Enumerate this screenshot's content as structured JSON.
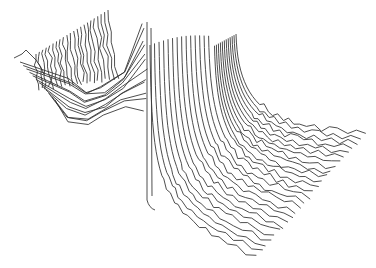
{
  "chart_data": {
    "type": "surface-waterfall-wireframe",
    "title": "",
    "xlabel": "",
    "ylabel": "",
    "zlabel": "",
    "grid": false,
    "legend": null,
    "axes_visible": false,
    "line_color": "#3a3a3a",
    "background": "#ffffff",
    "right_sheet": {
      "count": 26,
      "ridge_start": [
        150,
        45
      ],
      "ridge_peak": [
        232,
        34
      ],
      "end_first": [
        258,
        258
      ],
      "end_last": [
        366,
        134
      ]
    },
    "left_sheet": {
      "count": 22,
      "top_start": [
        14,
        58
      ],
      "top_end": [
        108,
        10
      ],
      "cliff_x": 147,
      "cliff_top": 22,
      "cliff_bottom": 200
    }
  }
}
